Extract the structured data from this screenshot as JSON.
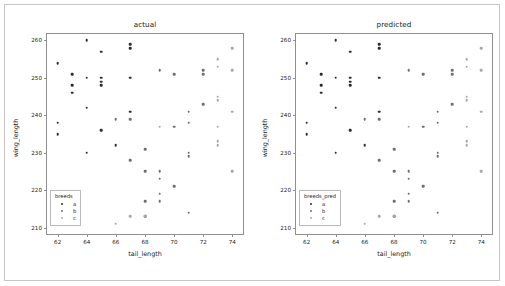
{
  "figure": {
    "width": 505,
    "height": 286,
    "background": "#ffffff",
    "border_color": "#c6c6c6"
  },
  "colors": {
    "a": "#2c2c2c",
    "b": "#6e6e6e",
    "c": "#a8a8a8",
    "axis": "#8f8f8f",
    "text": "#1a1a1a"
  },
  "chart_data": [
    {
      "type": "scatter",
      "title": "actual",
      "xlabel": "tail_length",
      "ylabel": "wing_length",
      "xlim": [
        61.2,
        74.8
      ],
      "ylim": [
        208.0,
        262.0
      ],
      "xticks": [
        62,
        64,
        66,
        68,
        70,
        72,
        74
      ],
      "yticks": [
        210,
        220,
        230,
        240,
        250,
        260
      ],
      "grid": false,
      "legend": {
        "title": "breeds",
        "position": "lower left",
        "entries": [
          "a",
          "b",
          "c"
        ]
      },
      "series": [
        {
          "name": "a",
          "color": "#2c2c2c",
          "points": [
            [
              62,
              254
            ],
            [
              62,
              238
            ],
            [
              62,
              235
            ],
            [
              63,
              251
            ],
            [
              63,
              248
            ],
            [
              63,
              246
            ],
            [
              64,
              260
            ],
            [
              64,
              250
            ],
            [
              64,
              242
            ],
            [
              64,
              230
            ],
            [
              65,
              257
            ],
            [
              65,
              250
            ],
            [
              65,
              249
            ],
            [
              65,
              248
            ],
            [
              65,
              236
            ],
            [
              66,
              232
            ],
            [
              67,
              259
            ],
            [
              67,
              258
            ],
            [
              67,
              250
            ],
            [
              67,
              241
            ]
          ]
        },
        {
          "name": "b",
          "color": "#6e6e6e",
          "points": [
            [
              66,
              239
            ],
            [
              67,
              239
            ],
            [
              67,
              228
            ],
            [
              68,
              231
            ],
            [
              68,
              225
            ],
            [
              68,
              217
            ],
            [
              68,
              213
            ],
            [
              69,
              252
            ],
            [
              69,
              225
            ],
            [
              69,
              223
            ],
            [
              69,
              219
            ],
            [
              69,
              217
            ],
            [
              70,
              251
            ],
            [
              70,
              237
            ],
            [
              70,
              221
            ],
            [
              71,
              241
            ],
            [
              71,
              238
            ],
            [
              71,
              230
            ],
            [
              71,
              229
            ],
            [
              71,
              214
            ],
            [
              72,
              252
            ],
            [
              72,
              251
            ],
            [
              72,
              243
            ]
          ]
        },
        {
          "name": "c",
          "color": "#a8a8a8",
          "points": [
            [
              66,
              211
            ],
            [
              67,
              213
            ],
            [
              68,
              213
            ],
            [
              69,
              237
            ],
            [
              73,
              255
            ],
            [
              73,
              253
            ],
            [
              73,
              245
            ],
            [
              73,
              244
            ],
            [
              73,
              237
            ],
            [
              73,
              233
            ],
            [
              73,
              232
            ],
            [
              74,
              258
            ],
            [
              74,
              252
            ],
            [
              74,
              241
            ],
            [
              74,
              225
            ]
          ]
        }
      ]
    },
    {
      "type": "scatter",
      "title": "predicted",
      "xlabel": "tail_length",
      "ylabel": "wing_length",
      "xlim": [
        61.2,
        74.8
      ],
      "ylim": [
        208.0,
        262.0
      ],
      "xticks": [
        62,
        64,
        66,
        68,
        70,
        72,
        74
      ],
      "yticks": [
        210,
        220,
        230,
        240,
        250,
        260
      ],
      "grid": false,
      "legend": {
        "title": "breeds_pred",
        "position": "lower left",
        "entries": [
          "a",
          "b",
          "c"
        ]
      },
      "series": [
        {
          "name": "a",
          "color": "#2c2c2c",
          "points": [
            [
              62,
              254
            ],
            [
              62,
              238
            ],
            [
              62,
              235
            ],
            [
              63,
              251
            ],
            [
              63,
              248
            ],
            [
              63,
              246
            ],
            [
              64,
              260
            ],
            [
              64,
              250
            ],
            [
              64,
              242
            ],
            [
              64,
              230
            ],
            [
              65,
              257
            ],
            [
              65,
              250
            ],
            [
              65,
              249
            ],
            [
              65,
              248
            ],
            [
              65,
              236
            ],
            [
              66,
              232
            ],
            [
              67,
              259
            ],
            [
              67,
              258
            ],
            [
              67,
              250
            ],
            [
              67,
              241
            ]
          ]
        },
        {
          "name": "b",
          "color": "#6e6e6e",
          "points": [
            [
              66,
              239
            ],
            [
              67,
              239
            ],
            [
              67,
              228
            ],
            [
              68,
              231
            ],
            [
              68,
              225
            ],
            [
              68,
              217
            ],
            [
              68,
              213
            ],
            [
              69,
              252
            ],
            [
              69,
              225
            ],
            [
              69,
              223
            ],
            [
              69,
              219
            ],
            [
              69,
              217
            ],
            [
              70,
              251
            ],
            [
              70,
              237
            ],
            [
              70,
              221
            ],
            [
              71,
              241
            ],
            [
              71,
              238
            ],
            [
              71,
              230
            ],
            [
              71,
              229
            ],
            [
              71,
              214
            ],
            [
              72,
              252
            ],
            [
              72,
              251
            ],
            [
              72,
              243
            ]
          ]
        },
        {
          "name": "c",
          "color": "#a8a8a8",
          "points": [
            [
              66,
              211
            ],
            [
              67,
              213
            ],
            [
              68,
              213
            ],
            [
              69,
              237
            ],
            [
              73,
              255
            ],
            [
              73,
              253
            ],
            [
              73,
              245
            ],
            [
              73,
              244
            ],
            [
              73,
              237
            ],
            [
              73,
              233
            ],
            [
              73,
              232
            ],
            [
              74,
              258
            ],
            [
              74,
              252
            ],
            [
              74,
              241
            ],
            [
              74,
              225
            ]
          ]
        }
      ]
    }
  ]
}
